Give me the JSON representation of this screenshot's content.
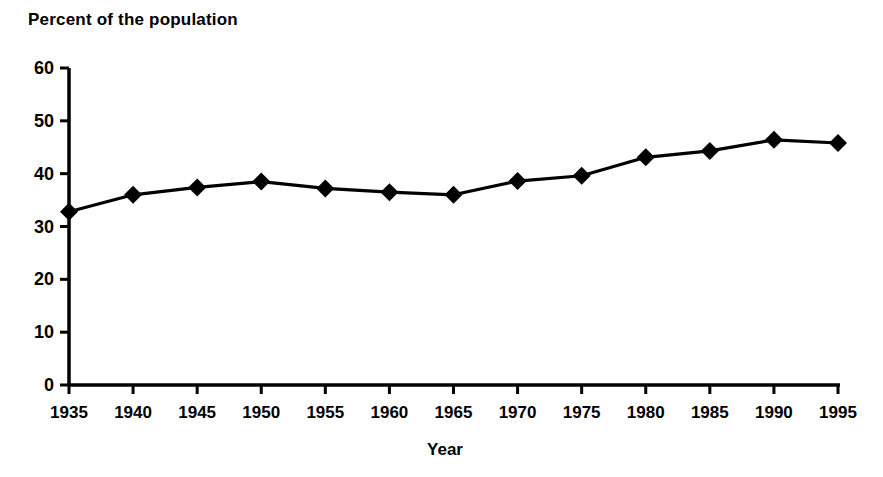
{
  "chart_data": {
    "type": "line",
    "title": "Percent of the population",
    "xlabel": "Year",
    "ylabel": "",
    "categories": [
      1935,
      1940,
      1945,
      1950,
      1955,
      1960,
      1965,
      1970,
      1975,
      1980,
      1985,
      1990,
      1995
    ],
    "x_tick_labels": [
      "1935",
      "1940",
      "1945",
      "1950",
      "1955",
      "1960",
      "1965",
      "1970",
      "1975",
      "1980",
      "1985",
      "1990",
      "1995"
    ],
    "values": [
      32.8,
      36.0,
      37.4,
      38.5,
      37.2,
      36.5,
      36.0,
      38.6,
      39.6,
      43.1,
      44.3,
      46.4,
      45.8
    ],
    "y_tick_labels": [
      "0",
      "10",
      "20",
      "30",
      "40",
      "50",
      "60"
    ],
    "y_ticks": [
      0,
      10,
      20,
      30,
      40,
      50,
      60
    ],
    "ylim": [
      0,
      60
    ],
    "xlim": [
      1935,
      1995
    ],
    "grid": false,
    "legend": null,
    "marker": "diamond",
    "series_color": "#000000",
    "background_color": "#ffffff"
  },
  "axes": {
    "x_axis_title": "Year"
  }
}
